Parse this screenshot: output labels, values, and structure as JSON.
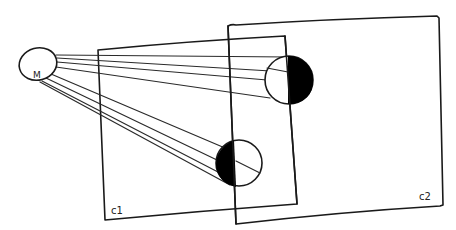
{
  "diagram": {
    "title": "",
    "background": "#ffffff",
    "ink_color": "#1a1a1a",
    "light_source": {
      "label": "M",
      "center": [
        38,
        64
      ],
      "rx": 19,
      "ry": 16
    },
    "frames": [
      {
        "id": "c1",
        "label": "C1",
        "label_text": "c1",
        "corners": [
          [
            98,
            50
          ],
          [
            285,
            36
          ],
          [
            297,
            204
          ],
          [
            105,
            220
          ]
        ]
      },
      {
        "id": "c2",
        "label": "C2",
        "label_text": "c2",
        "corners": [
          [
            228,
            26
          ],
          [
            437,
            16
          ],
          [
            443,
            205
          ],
          [
            236,
            224
          ]
        ]
      }
    ],
    "spheres": [
      {
        "id": "upper-sphere",
        "center": [
          289,
          80
        ],
        "r": 24,
        "shaded_side": "right",
        "shade_color": "#000000",
        "terminator_x": 288
      },
      {
        "id": "lower-sphere",
        "center": [
          239,
          163
        ],
        "r": 23,
        "shaded_side": "left",
        "shade_color": "#000000",
        "terminator_x": 236
      }
    ],
    "rays": {
      "to_upper_sphere": 4,
      "to_lower_sphere": 4
    }
  }
}
